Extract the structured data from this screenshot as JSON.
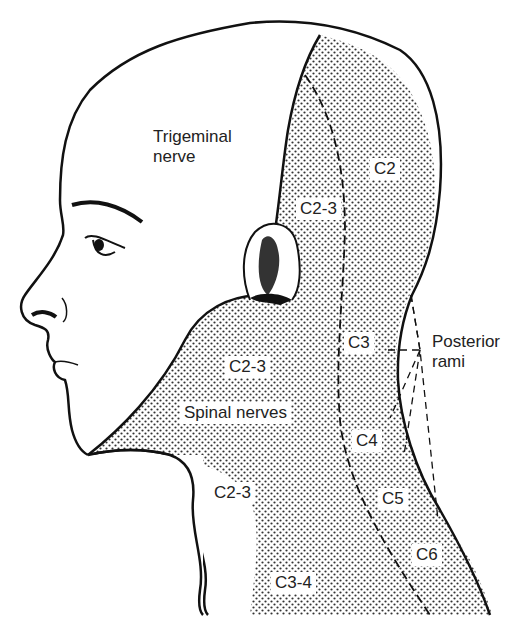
{
  "figure": {
    "colors": {
      "line": "#111111",
      "stipple": "#333333",
      "background": "#ffffff",
      "text": "#222222"
    }
  },
  "labels": {
    "trigeminal_line1": "Trigeminal",
    "trigeminal_line2": "nerve",
    "c2": "C2",
    "c2_3_upper": "C2-3",
    "c3": "C3",
    "posterior_line1": "Posterior",
    "posterior_line2": "rami",
    "c2_3_mid": "C2-3",
    "spinal_nerves": "Spinal nerves",
    "c4": "C4",
    "c2_3_lower": "C2-3",
    "c5": "C5",
    "c6": "C6",
    "c3_4": "C3-4"
  }
}
